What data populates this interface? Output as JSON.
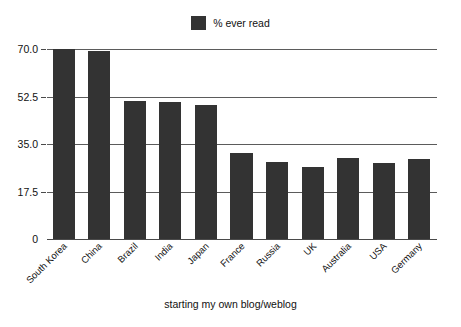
{
  "chart_data": {
    "type": "bar",
    "title": "",
    "subtitle": "",
    "xlabel": "starting my own blog/weblog",
    "ylabel": "",
    "categories": [
      "South Korea",
      "China",
      "Brazil",
      "India",
      "Japan",
      "France",
      "Russia",
      "UK",
      "Australia",
      "USA",
      "Germany"
    ],
    "series": [
      {
        "name": "% ever read",
        "color": "#333333",
        "values": [
          70.0,
          69.3,
          50.9,
          50.5,
          49.4,
          31.7,
          28.4,
          26.5,
          29.9,
          28.0,
          29.5
        ]
      }
    ],
    "ylim": [
      0,
      70
    ],
    "yticks": [
      "0",
      "17.5",
      "35.0",
      "52.5",
      "70.0"
    ],
    "ytick_values": [
      0,
      17.5,
      35,
      52.5,
      70
    ],
    "grid": true,
    "legend_position": "top-center",
    "legend_entries": [
      "% ever read"
    ]
  },
  "legend": {
    "label": "% ever read"
  },
  "axis": {
    "x_title": "starting my own blog/weblog"
  }
}
